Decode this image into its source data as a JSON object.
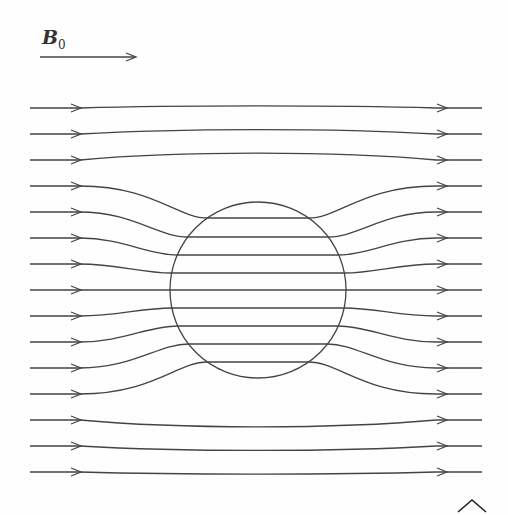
{
  "diagram": {
    "title_label": "B",
    "title_subscript": "0",
    "stroke_color": "#444444",
    "background": "#fefefe",
    "sphere": {
      "cx": 258,
      "cy": 290,
      "r": 88
    },
    "far_line_ys": [
      108,
      134,
      160,
      186,
      212,
      238,
      264,
      290,
      316,
      342,
      368,
      394,
      420,
      446,
      472
    ],
    "inner_line_ys": [
      218,
      237,
      255,
      273,
      290,
      308,
      326,
      344,
      362
    ]
  }
}
